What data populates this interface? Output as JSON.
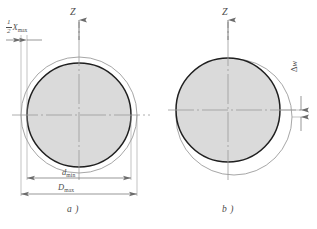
{
  "figure": {
    "type": "engineering-tolerance-diagram",
    "colors": {
      "shaft_fill": "#d9d9d9",
      "shaft_stroke": "#1a1a1a",
      "hole_stroke": "#8a8a8a",
      "centerline": "#9a9a9a",
      "dimension_line": "#6f6f6f",
      "text": "#4a4a4a",
      "background": "#ffffff"
    }
  },
  "panels": [
    {
      "id": "a",
      "caption": "a )",
      "description": "concentric shaft and hole, maximum clearance evenly distributed",
      "axis": {
        "label": "Z",
        "direction": "up"
      },
      "circles": {
        "hole": {
          "cx": 79,
          "cy": 115,
          "r": 58,
          "style": "thin-outline"
        },
        "shaft": {
          "cx": 79,
          "cy": 115,
          "r": 52,
          "style": "filled-bold"
        }
      },
      "dimensions": [
        {
          "name": "half-max-clearance",
          "label_num": "1",
          "label_den": "2",
          "label_var": "X",
          "label_sub": "max"
        },
        {
          "name": "shaft-min-diameter",
          "label_var": "d",
          "label_sub": "min"
        },
        {
          "name": "hole-max-diameter",
          "label_var": "D",
          "label_sub": "max"
        }
      ]
    },
    {
      "id": "b",
      "caption": "b )",
      "description": "eccentric shaft inside hole, clearance collected on one side",
      "axis": {
        "label": "Z",
        "direction": "up"
      },
      "circles": {
        "hole": {
          "cx": 234,
          "cy": 117,
          "r": 58,
          "style": "thin-outline"
        },
        "shaft": {
          "cx": 228,
          "cy": 110,
          "r": 52,
          "style": "filled-bold"
        }
      },
      "dimensions": [
        {
          "name": "eccentricity-offset",
          "label_sym": "Δ",
          "label_var": "w"
        }
      ]
    }
  ],
  "labels": {
    "z_axis_a": "Z",
    "z_axis_b": "Z",
    "caption_a": "a )",
    "caption_b": "b )",
    "frac_num": "1",
    "frac_den": "2",
    "x_var": "X",
    "x_sub": "max",
    "d_var": "d",
    "d_sub": "min",
    "D_var": "D",
    "D_sub": "max",
    "delta_sym": "Δ",
    "w_var": "w"
  }
}
